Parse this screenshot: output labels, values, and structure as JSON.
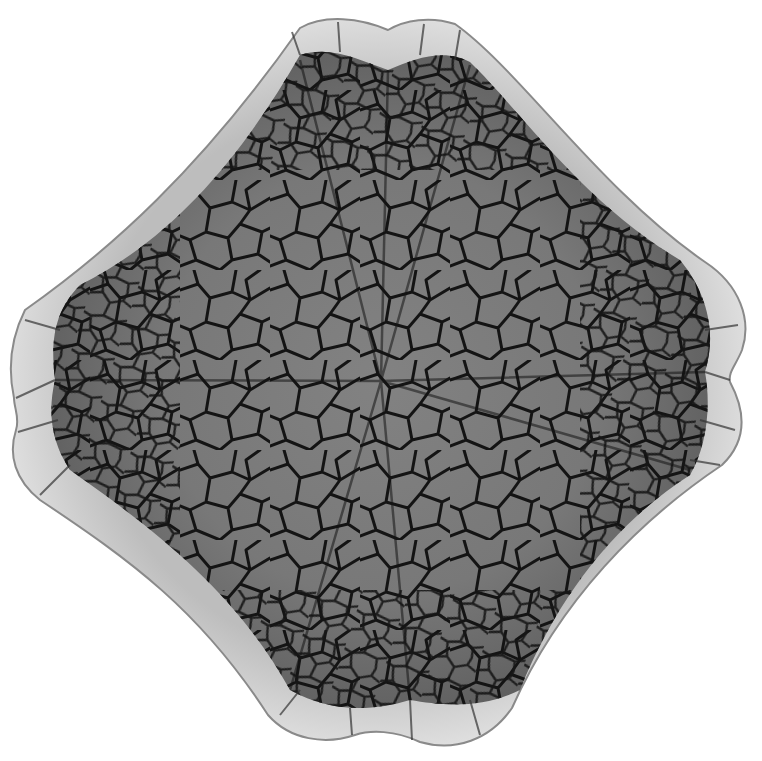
{
  "image": {
    "subject": "crackle-glazed quatrefoil ceramic dish viewed from above",
    "background": "#ffffff",
    "colors": {
      "rim": "#e2e2e2",
      "rim_shadow": "#9a9a9a",
      "interior": "#7b7b7b",
      "interior_dark": "#5e5e5e",
      "crackle": "#141414"
    }
  }
}
